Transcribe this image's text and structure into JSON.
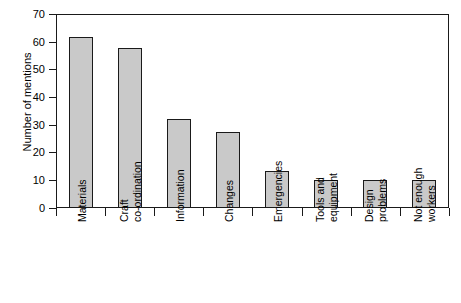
{
  "chart_data": {
    "type": "bar",
    "title": "",
    "subtitle": "",
    "xlabel": "",
    "ylabel": "Number of mentions",
    "ylim": [
      0,
      70
    ],
    "ytick_values": [
      0,
      10,
      20,
      30,
      40,
      50,
      60,
      70
    ],
    "ytick_labels": [
      "0",
      "10",
      "20",
      "30",
      "40",
      "50",
      "60",
      "70"
    ],
    "grid": false,
    "legend": false,
    "legend_position": "none",
    "bar_fill_color": "#c9c9c9",
    "bar_edge_color": "#1a1a1a",
    "categories": [
      "Materials",
      "Craft co-ordination",
      "Information",
      "Changes",
      "Emergencies",
      "Tools and equipment",
      "Design problems",
      "Not enough workers"
    ],
    "category_lines": [
      [
        "Materials"
      ],
      [
        "Craft",
        "co-ordination"
      ],
      [
        "Information"
      ],
      [
        "Changes"
      ],
      [
        "Emergencies"
      ],
      [
        "Tools and",
        "equipment"
      ],
      [
        "Design",
        "problems"
      ],
      [
        "Not enough",
        "workers"
      ]
    ],
    "values": [
      61.7,
      57.6,
      32,
      27.5,
      13.5,
      10,
      10,
      10
    ]
  }
}
